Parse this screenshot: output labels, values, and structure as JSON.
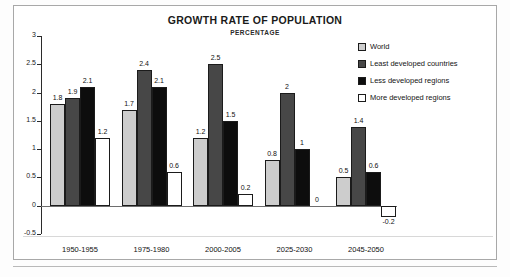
{
  "chart_data": {
    "type": "bar",
    "title": "GROWTH RATE OF POPULATION",
    "subtitle": "PERCENTAGE",
    "xlabel": "",
    "ylabel": "",
    "ylim": [
      -0.5,
      3
    ],
    "yticks": [
      3,
      2.5,
      2,
      1.5,
      1,
      0.5,
      0,
      -0.5
    ],
    "ytick_labels": [
      "3",
      "2.5",
      "2",
      "1.5",
      "1",
      "0.5",
      "0",
      "-0.5"
    ],
    "grid": false,
    "legend_position": "right",
    "categories": [
      "1950-1955",
      "1975-1980",
      "2000-2005",
      "2025-2030",
      "2045-2050"
    ],
    "series": [
      {
        "name": "World",
        "color": "#cdcdcd",
        "values": [
          1.8,
          1.7,
          1.2,
          0.8,
          0.5
        ],
        "labels": [
          "1.8",
          "1.7",
          "1.2",
          "0.8",
          "0.5"
        ]
      },
      {
        "name": "Least developed countries",
        "color": "#474747",
        "values": [
          1.9,
          2.4,
          2.5,
          2,
          1.4
        ],
        "labels": [
          "1.9",
          "2.4",
          "2.5",
          "2",
          "1.4"
        ]
      },
      {
        "name": "Less developed regions",
        "color": "#0d0d0d",
        "values": [
          2.1,
          2.1,
          1.5,
          1,
          0.6
        ],
        "labels": [
          "2.1",
          "2.1",
          "1.5",
          "1",
          "0.6"
        ]
      },
      {
        "name": "More developed regions",
        "color": "#ffffff",
        "values": [
          1.2,
          0.6,
          0.2,
          0,
          -0.2
        ],
        "labels": [
          "1.2",
          "0.6",
          "0.2",
          "0",
          "-0.2"
        ]
      }
    ]
  },
  "footnote": {
    "text": ""
  }
}
